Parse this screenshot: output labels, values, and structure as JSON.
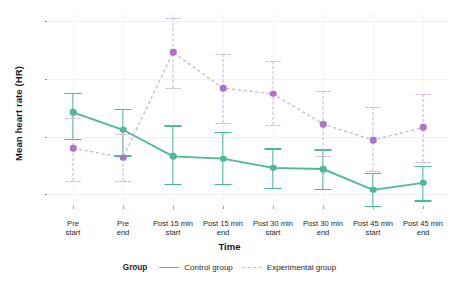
{
  "chart_data": {
    "type": "line",
    "title": "",
    "xlabel": "Time",
    "ylabel": "Mean heart rate (HR)",
    "categories": [
      "Pre\nstart",
      "Pre\nend",
      "Post 15 min\nstart",
      "Post 15 min\nend",
      "Post 30 min\nstart",
      "Post 30 min\nend",
      "Post 45 min\nstart",
      "Post 45 min\nend"
    ],
    "category_lines": [
      [
        "Pre",
        "start"
      ],
      [
        "Pre",
        "end"
      ],
      [
        "Post 15 min",
        "start"
      ],
      [
        "Post 15 min",
        "end"
      ],
      [
        "Post 30 min",
        "start"
      ],
      [
        "Post 30 min",
        "end"
      ],
      [
        "Post 45 min",
        "start"
      ],
      [
        "Post 45 min",
        "end"
      ]
    ],
    "ylim": [
      64.0,
      80.8
    ],
    "yticks": [
      65,
      70,
      75,
      80
    ],
    "ytick_labels": [
      "65",
      "70",
      "75",
      "80"
    ],
    "grid": true,
    "legend_position": "bottom",
    "legend_title": "Group",
    "series": [
      {
        "name": "Control group",
        "color": "#4db89a",
        "linestyle": "solid",
        "values": [
          72.1,
          70.6,
          68.3,
          68.1,
          67.3,
          67.2,
          65.4,
          66.0
        ],
        "err_low": [
          69.8,
          68.4,
          65.9,
          65.9,
          65.6,
          65.5,
          64.0,
          64.5
        ],
        "err_high": [
          73.8,
          72.4,
          71.0,
          70.4,
          69.0,
          68.9,
          66.9,
          67.5
        ]
      },
      {
        "name": "Experimental group",
        "color": "#cdb6dd",
        "marker_color": "#a874c4",
        "linestyle": "dashed",
        "values": [
          69.0,
          68.2,
          77.3,
          74.2,
          73.7,
          71.1,
          69.7,
          70.8
        ],
        "err_low": [
          66.2,
          66.2,
          74.2,
          71.2,
          71.0,
          68.3,
          67.0,
          67.8
        ],
        "err_high": [
          71.6,
          70.2,
          80.3,
          77.2,
          76.6,
          74.0,
          72.6,
          73.7
        ]
      }
    ]
  },
  "legend": {
    "title": "Group",
    "items": [
      {
        "label": "Control group",
        "style": "solid"
      },
      {
        "label": "Experimental group",
        "style": "dashed"
      }
    ]
  },
  "colors": {
    "control": "#4db89a",
    "experimental_line": "#cdb6dd",
    "experimental_marker": "#a874c4",
    "grid": "#f2f0f4",
    "background": "#ffffff",
    "text": "#1f1f1f"
  }
}
